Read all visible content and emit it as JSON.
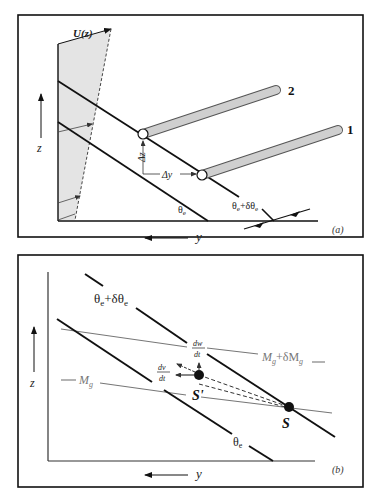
{
  "panel_a": {
    "tag": "(a)",
    "wind_label": "U(z)",
    "z_axis_label": "z",
    "y_axis_label": "y",
    "isentrope_lower": {
      "base": "θ",
      "sub": "e"
    },
    "isentrope_upper": {
      "base": "θ",
      "sub1": "e",
      "mid": "+δθ",
      "sub2": "e"
    },
    "delta_z_label": "Δz",
    "delta_y_label": "Δy",
    "tube_1_label": "1",
    "tube_2_label": "2"
  },
  "panel_b": {
    "tag": "(b)",
    "z_axis_label": "z",
    "y_axis_label": "y",
    "isentrope_upper": {
      "base": "θ",
      "sub1": "e",
      "mid": "+δθ",
      "sub2": "e"
    },
    "isentrope_lower": {
      "base": "θ",
      "sub": "e"
    },
    "mg_upper": {
      "base": "M",
      "sub1": "g",
      "mid": "+δM",
      "sub2": "g"
    },
    "mg_lower": {
      "base": "M",
      "sub": "g"
    },
    "dw_num": "dw",
    "dw_den": "dt",
    "dv_num": "dv",
    "dv_den": "dt",
    "point_s": "S",
    "point_s_prime": "S'"
  },
  "colors": {
    "line": "#111111",
    "gray_line": "#777777",
    "shade": "#e4e4e4",
    "tube_fill": "#cfcfcf"
  }
}
